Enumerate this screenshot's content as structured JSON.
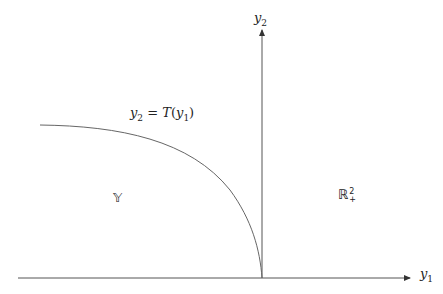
{
  "diagram": {
    "type": "production-possibility-set",
    "axes": {
      "x": {
        "var": "y",
        "sub": "1"
      },
      "y": {
        "var": "y",
        "sub": "2"
      }
    },
    "curve_label": {
      "lhs_var": "y",
      "lhs_sub": "2",
      "eq": " = ",
      "fn": "T",
      "open": "(",
      "arg_var": "y",
      "arg_sub": "1",
      "close": ")"
    },
    "region_left": "𝕐",
    "region_right": {
      "base": "ℝ",
      "sup": "2",
      "sub": "+"
    },
    "colors": {
      "axis": "#555555",
      "curve": "#666666",
      "text": "#222222"
    }
  }
}
